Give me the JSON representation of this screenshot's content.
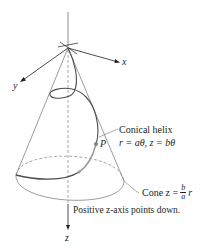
{
  "diagram": {
    "type": "3D conical helix illustration",
    "axes": {
      "x_label": "x",
      "y_label": "y",
      "z_label": "z"
    },
    "labels": {
      "helix_title": "Conical helix",
      "helix_equation": "r = aθ, z = bθ",
      "cone_prefix": "Cone z =",
      "cone_num": "b",
      "cone_den": "a",
      "cone_suffix": "r",
      "point_label": "P",
      "z_note": "Positive z-axis points down."
    },
    "colors": {
      "line": "#231f20",
      "helix": "#4d4d4f",
      "helix_highlight": "#9c9c9c",
      "dashed": "#6d6e71"
    }
  }
}
